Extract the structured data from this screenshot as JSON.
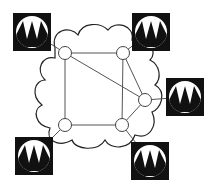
{
  "diagram": {
    "title": "",
    "cloud": {
      "name": "network-cloud",
      "stroke": "#000000",
      "fill": "#ffffff"
    },
    "nodes": [
      {
        "id": "n1",
        "x": 65,
        "y": 53
      },
      {
        "id": "n2",
        "x": 123,
        "y": 53
      },
      {
        "id": "n3",
        "x": 145,
        "y": 100
      },
      {
        "id": "n4",
        "x": 122,
        "y": 125
      },
      {
        "id": "n5",
        "x": 65,
        "y": 125
      }
    ],
    "links": [
      [
        "n1",
        "n2"
      ],
      [
        "n1",
        "n5"
      ],
      [
        "n1",
        "n3"
      ],
      [
        "n2",
        "n4"
      ],
      [
        "n2",
        "n3"
      ],
      [
        "n5",
        "n4"
      ],
      [
        "n4",
        "n3"
      ]
    ],
    "endpoints": [
      {
        "id": "e1",
        "icon": "waveform-station-icon",
        "x": 13,
        "y": 13,
        "attach": "n1"
      },
      {
        "id": "e2",
        "icon": "waveform-station-icon",
        "x": 132,
        "y": 13,
        "attach": "n2"
      },
      {
        "id": "e3",
        "icon": "waveform-station-icon",
        "x": 166,
        "y": 78,
        "attach": "n3"
      },
      {
        "id": "e4",
        "icon": "waveform-station-icon",
        "x": 131,
        "y": 142,
        "attach": "n4"
      },
      {
        "id": "e5",
        "icon": "waveform-station-icon",
        "x": 15,
        "y": 137,
        "attach": "n5"
      }
    ],
    "colors": {
      "line": "#555555",
      "icon_bg": "#111111",
      "icon_circle": "#ffffff"
    }
  }
}
